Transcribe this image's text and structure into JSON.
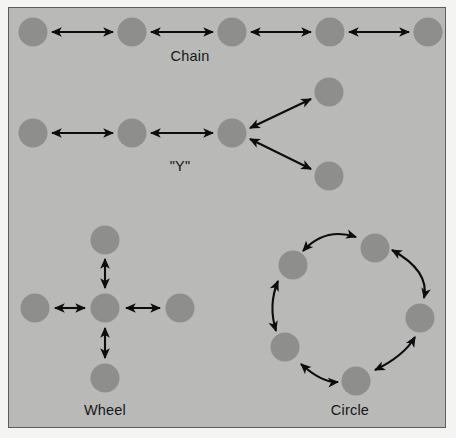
{
  "figure": {
    "type": "communication-network-topologies",
    "background_color": "#b9b9b7",
    "outer_background_color": "#f4f4f2",
    "border_color": "#5d5d5b",
    "node_color": "#8e8e8c",
    "arrow_color": "#0d0d10",
    "label_color": "#17171a"
  },
  "labels": {
    "chain": "Chain",
    "y": "\"Y\"",
    "wheel": "Wheel",
    "circle": "Circle"
  },
  "networks": [
    {
      "id": "chain",
      "label": "Chain",
      "node_count": 5,
      "nodes": [
        {
          "id": "c1",
          "cx": 33,
          "cy": 32
        },
        {
          "id": "c2",
          "cx": 132,
          "cy": 32
        },
        {
          "id": "c3",
          "cx": 232,
          "cy": 32
        },
        {
          "id": "c4",
          "cx": 330,
          "cy": 32
        },
        {
          "id": "c5",
          "cx": 428,
          "cy": 32
        }
      ],
      "links": [
        {
          "from": "c1",
          "to": "c2",
          "style": "straight",
          "arrowheads": "both"
        },
        {
          "from": "c2",
          "to": "c3",
          "style": "straight",
          "arrowheads": "both"
        },
        {
          "from": "c3",
          "to": "c4",
          "style": "straight",
          "arrowheads": "both"
        },
        {
          "from": "c4",
          "to": "c5",
          "style": "straight",
          "arrowheads": "both"
        }
      ],
      "label_pos": {
        "x": 190,
        "y": 55
      }
    },
    {
      "id": "y",
      "label": "\"Y\"",
      "node_count": 5,
      "nodes": [
        {
          "id": "y1",
          "cx": 33,
          "cy": 133
        },
        {
          "id": "y2",
          "cx": 132,
          "cy": 133
        },
        {
          "id": "y3",
          "cx": 232,
          "cy": 133
        },
        {
          "id": "y4",
          "cx": 329,
          "cy": 92
        },
        {
          "id": "y5",
          "cx": 329,
          "cy": 176
        }
      ],
      "links": [
        {
          "from": "y1",
          "to": "y2",
          "style": "straight",
          "arrowheads": "both"
        },
        {
          "from": "y2",
          "to": "y3",
          "style": "straight",
          "arrowheads": "both"
        },
        {
          "from": "y3",
          "to": "y4",
          "style": "straight",
          "arrowheads": "both"
        },
        {
          "from": "y3",
          "to": "y5",
          "style": "straight",
          "arrowheads": "both"
        }
      ],
      "label_pos": {
        "x": 180,
        "y": 167
      }
    },
    {
      "id": "wheel",
      "label": "Wheel",
      "node_count": 5,
      "nodes": [
        {
          "id": "w_center",
          "cx": 105,
          "cy": 308
        },
        {
          "id": "w_top",
          "cx": 105,
          "cy": 240
        },
        {
          "id": "w_bottom",
          "cx": 105,
          "cy": 378
        },
        {
          "id": "w_left",
          "cx": 35,
          "cy": 308
        },
        {
          "id": "w_right",
          "cx": 180,
          "cy": 308
        }
      ],
      "links": [
        {
          "from": "w_center",
          "to": "w_top",
          "style": "straight",
          "arrowheads": "both"
        },
        {
          "from": "w_center",
          "to": "w_bottom",
          "style": "straight",
          "arrowheads": "both"
        },
        {
          "from": "w_center",
          "to": "w_left",
          "style": "straight",
          "arrowheads": "both"
        },
        {
          "from": "w_center",
          "to": "w_right",
          "style": "straight",
          "arrowheads": "both"
        }
      ],
      "label_pos": {
        "x": 105,
        "y": 411
      }
    },
    {
      "id": "circle",
      "label": "Circle",
      "node_count": 6,
      "ring_center": {
        "cx": 350,
        "cy": 305
      },
      "ring_radius": 62,
      "nodes": [
        {
          "id": "r1",
          "cx": 375,
          "cy": 248
        },
        {
          "id": "r2",
          "cx": 293,
          "cy": 265
        },
        {
          "id": "r3",
          "cx": 285,
          "cy": 347
        },
        {
          "id": "r4",
          "cx": 356,
          "cy": 381
        },
        {
          "id": "r5",
          "cx": 420,
          "cy": 318
        },
        {
          "id": "r6",
          "cx": 410,
          "cy": 250
        }
      ],
      "links": [
        {
          "from": "r1",
          "to": "r2",
          "style": "curved",
          "arrowheads": "both"
        },
        {
          "from": "r2",
          "to": "r3",
          "style": "curved",
          "arrowheads": "both"
        },
        {
          "from": "r3",
          "to": "r4",
          "style": "curved",
          "arrowheads": "both"
        },
        {
          "from": "r4",
          "to": "r5",
          "style": "curved",
          "arrowheads": "both"
        },
        {
          "from": "r5",
          "to": "r1",
          "style": "curved",
          "arrowheads": "both"
        }
      ],
      "label_pos": {
        "x": 350,
        "y": 411
      }
    }
  ]
}
